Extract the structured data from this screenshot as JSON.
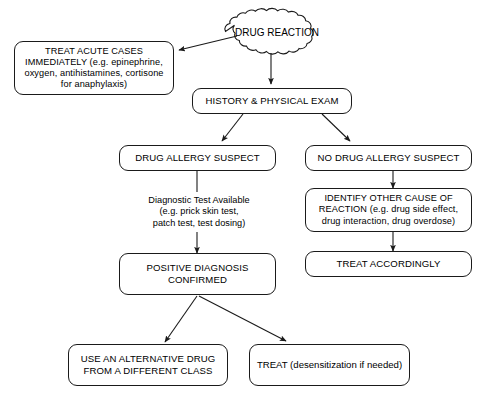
{
  "diagram": {
    "type": "flowchart",
    "background_color": "#ffffff",
    "line_color": "#1a1a1a",
    "text_color": "#000000",
    "nodes": [
      {
        "id": "drug-reaction",
        "shape": "cloud",
        "label": "DRUG REACTION"
      },
      {
        "id": "treat-acute-cases",
        "shape": "rounded-rect",
        "label": "TREAT ACUTE CASES\nIMMEDIATELY (e.g. epinephrine,\noxygen, antihistamines, cortisone\nfor anaphylaxis)"
      },
      {
        "id": "history-physical-exam",
        "shape": "rounded-rect",
        "label": "HISTORY & PHYSICAL EXAM"
      },
      {
        "id": "drug-allergy-suspect",
        "shape": "rounded-rect",
        "label": "DRUG ALLERGY SUSPECT"
      },
      {
        "id": "no-drug-allergy-suspect",
        "shape": "rounded-rect",
        "label": "NO DRUG ALLERGY SUSPECT"
      },
      {
        "id": "diagnostic-test-available",
        "shape": "plain-text",
        "label": "Diagnostic Test Available\n(e.g. prick skin test,\npatch test, test dosing)"
      },
      {
        "id": "identify-other-cause",
        "shape": "rounded-rect",
        "label": "IDENTIFY OTHER CAUSE OF\nREACTION (e.g. drug side effect,\ndrug interaction, drug overdose)"
      },
      {
        "id": "treat-accordingly",
        "shape": "rounded-rect",
        "label": "TREAT ACCORDINGLY"
      },
      {
        "id": "positive-diagnosis-confirmed",
        "shape": "rounded-rect",
        "label": "POSITIVE DIAGNOSIS\nCONFIRMED"
      },
      {
        "id": "use-alternative-drug",
        "shape": "rounded-rect",
        "label": "USE AN ALTERNATIVE DRUG\nFROM A DIFFERENT CLASS"
      },
      {
        "id": "treat-desensitization",
        "shape": "rounded-rect",
        "label": "TREAT (desensitization if needed)"
      }
    ],
    "edges": [
      {
        "from": "drug-reaction",
        "to": "treat-acute-cases",
        "style": "arrow"
      },
      {
        "from": "drug-reaction",
        "to": "history-physical-exam",
        "style": "arrow"
      },
      {
        "from": "history-physical-exam",
        "to": "drug-allergy-suspect",
        "style": "arrow"
      },
      {
        "from": "history-physical-exam",
        "to": "no-drug-allergy-suspect",
        "style": "arrow"
      },
      {
        "from": "drug-allergy-suspect",
        "to": "positive-diagnosis-confirmed",
        "style": "arrow",
        "label": "diagnostic-test-available"
      },
      {
        "from": "no-drug-allergy-suspect",
        "to": "identify-other-cause",
        "style": "arrow"
      },
      {
        "from": "identify-other-cause",
        "to": "treat-accordingly",
        "style": "arrow"
      },
      {
        "from": "positive-diagnosis-confirmed",
        "to": "use-alternative-drug",
        "style": "arrow"
      },
      {
        "from": "positive-diagnosis-confirmed",
        "to": "treat-desensitization",
        "style": "arrow"
      }
    ]
  }
}
